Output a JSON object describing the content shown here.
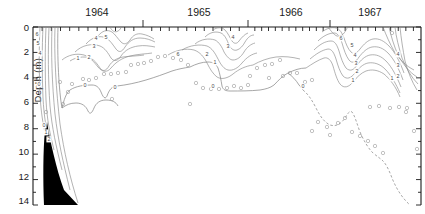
{
  "figure": {
    "title": "",
    "ylabel": "Depth (m)",
    "xlabel": ""
  },
  "chart_data": {
    "type": "line",
    "title": "",
    "xlabel": "",
    "ylabel": "Depth (m)",
    "ylim": [
      0,
      14
    ],
    "y_invert": true,
    "y_ticks": [
      "0",
      "2",
      "4",
      "6",
      "8",
      "10",
      "12",
      "14"
    ],
    "y_tick_values": [
      0,
      2,
      4,
      6,
      8,
      10,
      12,
      14
    ],
    "y_minor_tick_step": 1,
    "x_year_labels": [
      "1964",
      "1965",
      "1966",
      "1967"
    ],
    "x_year_label_positions": [
      97,
      199,
      291,
      370
    ],
    "x_year_boundaries": [
      143,
      248,
      330
    ],
    "x_minor_tick_step_months": 1,
    "grid": false,
    "legend": null,
    "contour_labels": [
      "0",
      "1",
      "2",
      "3",
      "4",
      "5",
      "6"
    ],
    "contour_label_note": "isopleth values in units of the contoured variable",
    "series": [
      {
        "name": "contour-6",
        "label": "6",
        "values": [
          6
        ]
      },
      {
        "name": "contour-5",
        "label": "5",
        "values": [
          5
        ]
      },
      {
        "name": "contour-4",
        "label": "4",
        "values": [
          4
        ]
      },
      {
        "name": "contour-3",
        "label": "3",
        "values": [
          3
        ]
      },
      {
        "name": "contour-2",
        "label": "2",
        "values": [
          2
        ]
      },
      {
        "name": "contour-1",
        "label": "1",
        "values": [
          1
        ]
      },
      {
        "name": "contour-0",
        "label": "0",
        "values": [
          0
        ]
      }
    ],
    "sample_points_note": "open circles mark individual sounding / sample depths",
    "sample_points_count": 62,
    "dashed_segment_note": "0-isopleth dashed where inferred (1966-1967)",
    "black_wedge_note": "filled black wedge at left margin, 7-14 m depth"
  },
  "contour_label_markers": [
    {
      "text": "6",
      "x": 37,
      "y": 36
    },
    {
      "text": "5",
      "x": 38,
      "y": 45
    },
    {
      "text": "4",
      "x": 40,
      "y": 55
    },
    {
      "text": "0",
      "x": 44,
      "y": 127
    },
    {
      "text": "1",
      "x": 46,
      "y": 134
    },
    {
      "text": "2",
      "x": 49,
      "y": 141
    },
    {
      "text": "1",
      "x": 78,
      "y": 60
    },
    {
      "text": "2",
      "x": 89,
      "y": 59
    },
    {
      "text": "3",
      "x": 94,
      "y": 48
    },
    {
      "text": "4",
      "x": 96,
      "y": 40
    },
    {
      "text": "5",
      "x": 106,
      "y": 39
    },
    {
      "text": "0",
      "x": 39,
      "y": 86
    },
    {
      "text": "0",
      "x": 85,
      "y": 87
    },
    {
      "text": "6",
      "x": 178,
      "y": 56
    },
    {
      "text": "0",
      "x": 115,
      "y": 89
    },
    {
      "text": "1",
      "x": 215,
      "y": 64
    },
    {
      "text": "2",
      "x": 207,
      "y": 56
    },
    {
      "text": "3",
      "x": 228,
      "y": 48
    },
    {
      "text": "4",
      "x": 233,
      "y": 39
    },
    {
      "text": "0",
      "x": 213,
      "y": 88
    },
    {
      "text": "0",
      "x": 303,
      "y": 88
    },
    {
      "text": "6",
      "x": 341,
      "y": 40
    },
    {
      "text": "5",
      "x": 352,
      "y": 47
    },
    {
      "text": "4",
      "x": 355,
      "y": 57
    },
    {
      "text": "3",
      "x": 356,
      "y": 65
    },
    {
      "text": "2",
      "x": 357,
      "y": 73
    },
    {
      "text": "1",
      "x": 353,
      "y": 82
    },
    {
      "text": "1",
      "x": 392,
      "y": 80
    },
    {
      "text": "2",
      "x": 398,
      "y": 78
    },
    {
      "text": "3",
      "x": 398,
      "y": 67
    },
    {
      "text": "4",
      "x": 398,
      "y": 56
    }
  ],
  "sample_points": [
    {
      "x": 63,
      "y": 104
    },
    {
      "x": 46,
      "y": 112
    },
    {
      "x": 72,
      "y": 84
    },
    {
      "x": 68,
      "y": 92
    },
    {
      "x": 96,
      "y": 78
    },
    {
      "x": 104,
      "y": 74
    },
    {
      "x": 111,
      "y": 74
    },
    {
      "x": 118,
      "y": 73
    },
    {
      "x": 126,
      "y": 72
    },
    {
      "x": 131,
      "y": 65
    },
    {
      "x": 138,
      "y": 64
    },
    {
      "x": 144,
      "y": 63
    },
    {
      "x": 151,
      "y": 61
    },
    {
      "x": 158,
      "y": 57
    },
    {
      "x": 165,
      "y": 56
    },
    {
      "x": 173,
      "y": 58
    },
    {
      "x": 181,
      "y": 60
    },
    {
      "x": 188,
      "y": 65
    },
    {
      "x": 196,
      "y": 83
    },
    {
      "x": 203,
      "y": 88
    },
    {
      "x": 211,
      "y": 89
    },
    {
      "x": 219,
      "y": 89
    },
    {
      "x": 227,
      "y": 88
    },
    {
      "x": 234,
      "y": 86
    },
    {
      "x": 241,
      "y": 88
    },
    {
      "x": 250,
      "y": 76
    },
    {
      "x": 257,
      "y": 68
    },
    {
      "x": 265,
      "y": 65
    },
    {
      "x": 272,
      "y": 64
    },
    {
      "x": 280,
      "y": 60
    },
    {
      "x": 290,
      "y": 73
    },
    {
      "x": 297,
      "y": 73
    },
    {
      "x": 305,
      "y": 82
    },
    {
      "x": 312,
      "y": 80
    },
    {
      "x": 190,
      "y": 104
    },
    {
      "x": 112,
      "y": 99
    },
    {
      "x": 318,
      "y": 122
    },
    {
      "x": 327,
      "y": 127
    },
    {
      "x": 312,
      "y": 131
    },
    {
      "x": 338,
      "y": 123
    },
    {
      "x": 345,
      "y": 118
    },
    {
      "x": 330,
      "y": 135
    },
    {
      "x": 352,
      "y": 132
    },
    {
      "x": 360,
      "y": 136
    },
    {
      "x": 368,
      "y": 141
    },
    {
      "x": 375,
      "y": 146
    },
    {
      "x": 383,
      "y": 153
    },
    {
      "x": 390,
      "y": 108
    },
    {
      "x": 399,
      "y": 107
    },
    {
      "x": 407,
      "y": 108
    },
    {
      "x": 414,
      "y": 131
    },
    {
      "x": 406,
      "y": 112
    },
    {
      "x": 370,
      "y": 107
    },
    {
      "x": 379,
      "y": 106
    },
    {
      "x": 417,
      "y": 149
    },
    {
      "x": 60,
      "y": 82
    },
    {
      "x": 83,
      "y": 79
    },
    {
      "x": 89,
      "y": 80
    },
    {
      "x": 248,
      "y": 85
    },
    {
      "x": 269,
      "y": 78
    },
    {
      "x": 283,
      "y": 76
    },
    {
      "x": 392,
      "y": 33
    }
  ]
}
